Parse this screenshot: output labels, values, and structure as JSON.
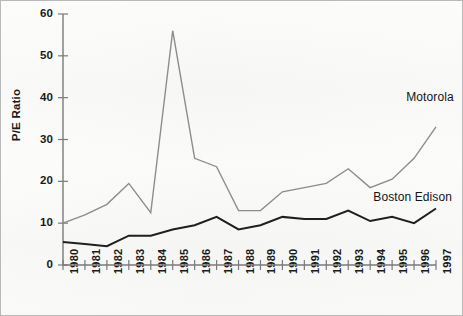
{
  "chart_data": {
    "type": "line",
    "title": "",
    "xlabel": "",
    "ylabel": "P/E Ratio",
    "xlim": [
      1980,
      1997
    ],
    "ylim": [
      0,
      60
    ],
    "yticks": [
      0,
      10,
      20,
      30,
      40,
      50,
      60
    ],
    "grid": false,
    "legend_position": "inline-right",
    "categories": [
      "1980",
      "1981",
      "1982",
      "1983",
      "1984",
      "1985",
      "1986",
      "1987",
      "1988",
      "1989",
      "1990",
      "1991",
      "1992",
      "1993",
      "1994",
      "1995",
      "1996",
      "1997"
    ],
    "x": [
      1980,
      1981,
      1982,
      1983,
      1984,
      1985,
      1986,
      1987,
      1988,
      1989,
      1990,
      1991,
      1992,
      1993,
      1994,
      1995,
      1996,
      1997
    ],
    "series": [
      {
        "name": "Motorola",
        "color": "#8c8c8c",
        "values": [
          10.0,
          12.0,
          14.5,
          19.5,
          12.5,
          56.0,
          25.5,
          23.5,
          13.0,
          13.0,
          17.5,
          18.5,
          19.5,
          23.0,
          18.5,
          20.5,
          25.5,
          33.0
        ]
      },
      {
        "name": "Boston Edison",
        "color": "#1f1f1f",
        "values": [
          5.5,
          5.0,
          4.5,
          7.0,
          7.0,
          8.5,
          9.5,
          11.5,
          8.5,
          9.5,
          11.5,
          11.0,
          11.0,
          13.0,
          10.5,
          11.5,
          10.0,
          13.5
        ]
      }
    ],
    "annotations": [
      {
        "text": "Motorola",
        "x": 1996.1,
        "y": 40.0
      },
      {
        "text": "Boston Edison",
        "x": 1994.6,
        "y": 16.0
      }
    ]
  },
  "axes": {
    "y_tick_labels": [
      "60",
      "50",
      "40",
      "30",
      "20",
      "10",
      "0"
    ],
    "x_tick_labels": [
      "1980",
      "1981",
      "1982",
      "1983",
      "1984",
      "1985",
      "1986",
      "1987",
      "1988",
      "1989",
      "1990",
      "1991",
      "1992",
      "1993",
      "1994",
      "1995",
      "1996",
      "1997"
    ],
    "y_axis_title": "P/E Ratio"
  },
  "colors": {
    "motorola_line": "#8c8c8c",
    "boston_edison_line": "#1f1f1f",
    "axis": "#7a7a7a",
    "text": "#1a1a1a",
    "background": "#f7f7f5",
    "frame_border": "#b9b9b9"
  }
}
